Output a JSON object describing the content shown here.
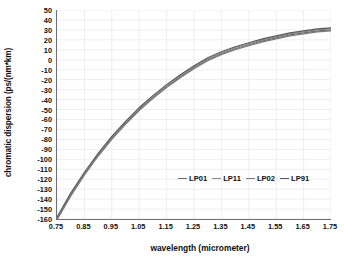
{
  "chart_data": {
    "type": "line",
    "title": "",
    "xlabel": "wavelength (micrometer)",
    "ylabel": "chromatic dispersion (ps/(nm*km)",
    "xlim": [
      0.75,
      1.75
    ],
    "ylim": [
      -160,
      50
    ],
    "grid": true,
    "legend_position": "inside-bottom-center",
    "xticks": [
      "0.75",
      "0.85",
      "0.95",
      "1.05",
      "1.15",
      "1.25",
      "1.35",
      "1.45",
      "1.55",
      "1.65",
      "1.75"
    ],
    "xtick_values": [
      0.75,
      0.85,
      0.95,
      1.05,
      1.15,
      1.25,
      1.35,
      1.45,
      1.55,
      1.65,
      1.75
    ],
    "yticks": [
      "50",
      "40",
      "30",
      "20",
      "10",
      "0",
      "-10",
      "-20",
      "-30",
      "-40",
      "-50",
      "-60",
      "-70",
      "-80",
      "-90",
      "-100",
      "-110",
      "-120",
      "-130",
      "-140",
      "-150",
      "-160"
    ],
    "ytick_values": [
      50,
      40,
      30,
      20,
      10,
      0,
      -10,
      -20,
      -30,
      -40,
      -50,
      -60,
      -70,
      -80,
      -90,
      -100,
      -110,
      -120,
      -130,
      -140,
      -150,
      -160
    ],
    "x": [
      0.75,
      0.8,
      0.85,
      0.9,
      0.95,
      1.0,
      1.05,
      1.1,
      1.15,
      1.2,
      1.25,
      1.3,
      1.35,
      1.4,
      1.45,
      1.5,
      1.55,
      1.6,
      1.65,
      1.7,
      1.75
    ],
    "series": [
      {
        "name": "LP01",
        "color": "#6b6b6b",
        "values": [
          -160,
          -136,
          -115,
          -96,
          -79,
          -64,
          -50,
          -38,
          -27,
          -17,
          -8,
          0,
          6,
          11,
          15,
          19,
          22,
          25,
          27,
          29,
          30
        ]
      },
      {
        "name": "LP11",
        "color": "#8a8a8a",
        "values": [
          -159,
          -135,
          -114,
          -95,
          -78,
          -63,
          -49,
          -37,
          -26,
          -16,
          -7,
          1,
          7,
          12,
          16,
          20,
          23,
          26,
          28,
          30,
          31
        ]
      },
      {
        "name": "LP02",
        "color": "#7a7a7a",
        "values": [
          -161,
          -137,
          -116,
          -97,
          -80,
          -65,
          -51,
          -39,
          -28,
          -18,
          -9,
          -1,
          5,
          10,
          14,
          18,
          21,
          24,
          26,
          28,
          29
        ]
      },
      {
        "name": "LP91",
        "color": "#595959",
        "values": [
          -158,
          -134,
          -113,
          -94,
          -77,
          -62,
          -48,
          -36,
          -25,
          -15,
          -6,
          2,
          8,
          13,
          17,
          21,
          24,
          27,
          29,
          31,
          32
        ]
      }
    ]
  },
  "legend": {
    "items": [
      {
        "label": "LP01"
      },
      {
        "label": "LP11"
      },
      {
        "label": "LP02"
      },
      {
        "label": "LP91"
      }
    ]
  }
}
